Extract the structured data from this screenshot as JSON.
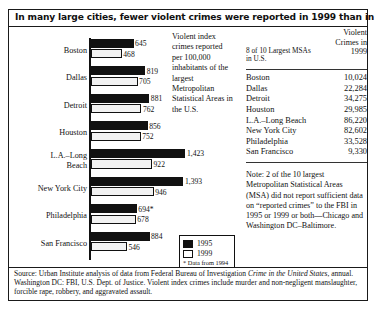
{
  "title": "In many large cities, fewer violent crimes were reported in 1999 than in 1995",
  "explanation": "Violent index crimes reported per 100,000 inhabitants of the largest Metropolitan Statistical Areas in the U.S.",
  "legend": {
    "item_1995": "1995",
    "item_1999": "1999",
    "footnote": "* Data from 1994"
  },
  "table": {
    "header_left": "8 of 10 Largest MSAs in U.S.",
    "header_right": "Violent Crimes in 1999",
    "rows": [
      {
        "city": "Boston",
        "value": "10,024"
      },
      {
        "city": "Dallas",
        "value": "22,284"
      },
      {
        "city": "Detroit",
        "value": "34,275"
      },
      {
        "city": "Houston",
        "value": "29,985"
      },
      {
        "city": "L.A.–Long Beach",
        "value": "86,220"
      },
      {
        "city": "New York City",
        "value": "82,602"
      },
      {
        "city": "Philadelphia",
        "value": "33,528"
      },
      {
        "city": "San Francisco",
        "value": "9,330"
      }
    ],
    "note": "Note: 2 of the 10 largest Metropolitan Statistical Areas (MSA) did not report sufficient data on “reported crimes” to the FBI in 1995 or 1999 or both—Chicago and Washington DC–Baltimore."
  },
  "source": {
    "part1": "Source: Urban Institute analysis of data from Federal Bureau of Investigation ",
    "italic": "Crime in the United States",
    "part2": ", annual. Washington DC: FBI, U.S. Dept. of Justice. Violent index crimes include murder and non-negligent manslaughter, forcible rape, robbery, and aggravated assault."
  },
  "chart_data": {
    "type": "bar",
    "orientation": "horizontal",
    "title": "In many large cities, fewer violent crimes were reported in 1999 than in 1995",
    "xlabel": "Violent index crimes reported per 100,000 inhabitants",
    "ylabel": "",
    "categories": [
      "Boston",
      "Dallas",
      "Detroit",
      "Houston",
      "L.A.–Long Beach",
      "New York City",
      "Philadelphia",
      "San Francisco"
    ],
    "category_lines": [
      [
        "Boston"
      ],
      [
        "Dallas"
      ],
      [
        "Detroit"
      ],
      [
        "Houston"
      ],
      [
        "L.A.–Long",
        "Beach"
      ],
      [
        "New York City"
      ],
      [
        "Philadelphia"
      ],
      [
        "San Francisco"
      ]
    ],
    "series": [
      {
        "name": "1995",
        "color": "#111111",
        "values": [
          645,
          819,
          881,
          856,
          1423,
          1393,
          694,
          884
        ],
        "labels": [
          "645",
          "819",
          "881",
          "856",
          "1,423",
          "1,393",
          "694*",
          "884"
        ]
      },
      {
        "name": "1999",
        "color": "#f2f2f2",
        "values": [
          468,
          705,
          762,
          752,
          922,
          946,
          678,
          546
        ],
        "labels": [
          "468",
          "705",
          "762",
          "752",
          "922",
          "946",
          "678",
          "546"
        ]
      }
    ],
    "xlim": [
      0,
      1500
    ],
    "grid": false,
    "legend_position": "bottom-right",
    "annotations": [
      "* Data from 1994"
    ]
  }
}
